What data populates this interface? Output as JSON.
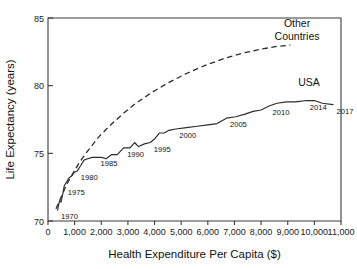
{
  "chart_data": {
    "type": "line",
    "title": "",
    "xlabel": "Health Expenditure Per Capita ($)",
    "ylabel": "Life Expectancy (years)",
    "xlim": [
      0,
      11000
    ],
    "ylim": [
      70,
      85
    ],
    "xticks": [
      0,
      1000,
      2000,
      3000,
      4000,
      5000,
      6000,
      7000,
      8000,
      9000,
      10000,
      11000
    ],
    "xticklabels": [
      "0",
      "1,000",
      "2,000",
      "3,000",
      "4,000",
      "5,000",
      "6,000",
      "7,000",
      "8,000",
      "9,000",
      "10,000",
      "11,000"
    ],
    "yticks": [
      70,
      75,
      80,
      85
    ],
    "yticklabels": [
      "70",
      "75",
      "80",
      "85"
    ],
    "grid": false,
    "legend_position": "inline-annotation",
    "series": [
      {
        "name": "USA",
        "style": "solid",
        "label_x": 9700,
        "label_y": 79.9,
        "points": [
          {
            "x": 360,
            "y": 70.8,
            "label": "1970"
          },
          {
            "x": 400,
            "y": 71.2,
            "label": ""
          },
          {
            "x": 440,
            "y": 71.5,
            "label": ""
          },
          {
            "x": 490,
            "y": 71.4,
            "label": ""
          },
          {
            "x": 545,
            "y": 71.9,
            "label": ""
          },
          {
            "x": 610,
            "y": 72.6,
            "label": "1975"
          },
          {
            "x": 700,
            "y": 72.9,
            "label": ""
          },
          {
            "x": 790,
            "y": 73.2,
            "label": ""
          },
          {
            "x": 880,
            "y": 73.3,
            "label": ""
          },
          {
            "x": 990,
            "y": 73.6,
            "label": ""
          },
          {
            "x": 1100,
            "y": 73.7,
            "label": "1980"
          },
          {
            "x": 1230,
            "y": 74.1,
            "label": ""
          },
          {
            "x": 1350,
            "y": 74.5,
            "label": ""
          },
          {
            "x": 1490,
            "y": 74.6,
            "label": ""
          },
          {
            "x": 1660,
            "y": 74.7,
            "label": ""
          },
          {
            "x": 1840,
            "y": 74.7,
            "label": "1985"
          },
          {
            "x": 2010,
            "y": 74.7,
            "label": ""
          },
          {
            "x": 2180,
            "y": 74.6,
            "label": ""
          },
          {
            "x": 2380,
            "y": 74.9,
            "label": ""
          },
          {
            "x": 2600,
            "y": 74.9,
            "label": ""
          },
          {
            "x": 2840,
            "y": 75.4,
            "label": "1990"
          },
          {
            "x": 3080,
            "y": 75.4,
            "label": ""
          },
          {
            "x": 3250,
            "y": 75.8,
            "label": ""
          },
          {
            "x": 3400,
            "y": 75.5,
            "label": ""
          },
          {
            "x": 3620,
            "y": 75.7,
            "label": ""
          },
          {
            "x": 3840,
            "y": 75.8,
            "label": "1995"
          },
          {
            "x": 4020,
            "y": 76.1,
            "label": ""
          },
          {
            "x": 4180,
            "y": 76.5,
            "label": ""
          },
          {
            "x": 4360,
            "y": 76.5,
            "label": ""
          },
          {
            "x": 4540,
            "y": 76.7,
            "label": ""
          },
          {
            "x": 4800,
            "y": 76.8,
            "label": "2000"
          },
          {
            "x": 5200,
            "y": 76.9,
            "label": ""
          },
          {
            "x": 5600,
            "y": 77.0,
            "label": ""
          },
          {
            "x": 6000,
            "y": 77.1,
            "label": ""
          },
          {
            "x": 6350,
            "y": 77.2,
            "label": ""
          },
          {
            "x": 6700,
            "y": 77.6,
            "label": "2005"
          },
          {
            "x": 7050,
            "y": 77.7,
            "label": ""
          },
          {
            "x": 7400,
            "y": 77.9,
            "label": ""
          },
          {
            "x": 7700,
            "y": 78.1,
            "label": ""
          },
          {
            "x": 8000,
            "y": 78.2,
            "label": ""
          },
          {
            "x": 8300,
            "y": 78.5,
            "label": "2010"
          },
          {
            "x": 8600,
            "y": 78.7,
            "label": ""
          },
          {
            "x": 8950,
            "y": 78.8,
            "label": ""
          },
          {
            "x": 9300,
            "y": 78.8,
            "label": ""
          },
          {
            "x": 9700,
            "y": 78.9,
            "label": "2014"
          },
          {
            "x": 10000,
            "y": 78.9,
            "label": ""
          },
          {
            "x": 10300,
            "y": 78.7,
            "label": ""
          },
          {
            "x": 10700,
            "y": 78.6,
            "label": "2017"
          }
        ]
      },
      {
        "name": "Other Countries",
        "style": "dashed",
        "label_x": 9300,
        "label_y": 84.0,
        "points": [
          {
            "x": 300,
            "y": 70.9,
            "label": ""
          },
          {
            "x": 500,
            "y": 71.8,
            "label": ""
          },
          {
            "x": 700,
            "y": 72.7,
            "label": ""
          },
          {
            "x": 900,
            "y": 73.4,
            "label": ""
          },
          {
            "x": 1200,
            "y": 74.4,
            "label": ""
          },
          {
            "x": 1500,
            "y": 75.2,
            "label": ""
          },
          {
            "x": 1900,
            "y": 76.2,
            "label": ""
          },
          {
            "x": 2300,
            "y": 77.0,
            "label": ""
          },
          {
            "x": 2800,
            "y": 77.9,
            "label": ""
          },
          {
            "x": 3300,
            "y": 78.7,
            "label": ""
          },
          {
            "x": 3900,
            "y": 79.5,
            "label": ""
          },
          {
            "x": 4500,
            "y": 80.2,
            "label": ""
          },
          {
            "x": 5200,
            "y": 80.9,
            "label": ""
          },
          {
            "x": 5900,
            "y": 81.5,
            "label": ""
          },
          {
            "x": 6600,
            "y": 82.0,
            "label": ""
          },
          {
            "x": 7300,
            "y": 82.4,
            "label": ""
          },
          {
            "x": 8000,
            "y": 82.7,
            "label": ""
          },
          {
            "x": 8600,
            "y": 82.9,
            "label": ""
          },
          {
            "x": 9100,
            "y": 83.0,
            "label": ""
          }
        ]
      }
    ],
    "annotations": [
      {
        "name": "other-countries-label-line1",
        "text": "Other",
        "x": 9350,
        "y": 84.3
      },
      {
        "name": "other-countries-label-line2",
        "text": "Countries",
        "x": 9350,
        "y": 83.4
      },
      {
        "name": "usa-label",
        "text": "USA",
        "x": 9800,
        "y": 80.0
      }
    ]
  }
}
